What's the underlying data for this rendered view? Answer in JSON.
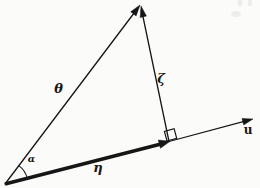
{
  "figure": {
    "type": "vector-projection-diagram",
    "colors": {
      "ink": "#161616",
      "paper": "#fbfbfa",
      "noise": "#ededed"
    },
    "labels": {
      "theta": "θ",
      "zeta": "ζ",
      "eta": "η",
      "alpha": "α",
      "u": "u"
    },
    "parts": [
      "theta-vector",
      "zeta-vector",
      "eta-vector",
      "u-ray",
      "alpha-angle-arc",
      "right-angle-marker"
    ]
  }
}
